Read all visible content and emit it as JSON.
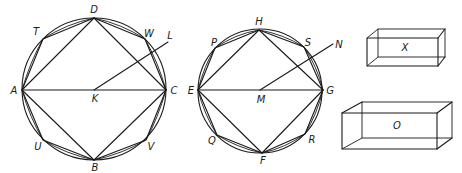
{
  "figure": {
    "circle_1": {
      "center_label": "K",
      "radius_end_label": "L",
      "square_vertices": [
        "A",
        "D",
        "C",
        "B"
      ],
      "octagon_midpoints": [
        "T",
        "W",
        "V",
        "U"
      ],
      "labels": {
        "A": "A",
        "B": "B",
        "C": "C",
        "D": "D",
        "K": "K",
        "L": "L",
        "T": "T",
        "U": "U",
        "V": "V",
        "W": "W"
      }
    },
    "circle_2": {
      "center_label": "M",
      "radius_end_label": "N",
      "square_vertices": [
        "E",
        "H",
        "G",
        "F"
      ],
      "octagon_midpoints": [
        "P",
        "S",
        "R",
        "Q"
      ],
      "labels": {
        "E": "E",
        "F": "F",
        "G": "G",
        "H": "H",
        "M": "M",
        "N": "N",
        "P": "P",
        "Q": "Q",
        "R": "R",
        "S": "S"
      }
    },
    "solids": [
      {
        "label": "X"
      },
      {
        "label": "O"
      }
    ]
  }
}
